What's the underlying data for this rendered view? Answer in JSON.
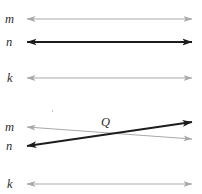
{
  "figure": {
    "width": 202,
    "height": 194,
    "background": "#ffffff",
    "colors": {
      "light_line": "#a9a9a9",
      "dark_line": "#1c1c1c",
      "label_text": "#2b2b2b"
    }
  },
  "panels": [
    {
      "id": "panel-top",
      "description": "Three parallel horizontal lines labeled m, n, k",
      "lines": [
        {
          "name": "line-m-top",
          "label": "m",
          "style": "light",
          "color": "#a9a9a9",
          "stroke_width": 1.1,
          "x1": 27,
          "y1": 19,
          "x2": 192,
          "y2": 19,
          "arrow_start": true,
          "arrow_end": true,
          "label_x": 5,
          "label_y": 13
        },
        {
          "name": "line-n-top",
          "label": "n",
          "style": "dark",
          "color": "#1c1c1c",
          "stroke_width": 1.8,
          "x1": 27,
          "y1": 42,
          "x2": 192,
          "y2": 42,
          "arrow_start": true,
          "arrow_end": true,
          "label_x": 6,
          "label_y": 36
        },
        {
          "name": "line-k-top",
          "label": "k",
          "style": "light",
          "color": "#a9a9a9",
          "stroke_width": 1.1,
          "x1": 27,
          "y1": 78,
          "x2": 192,
          "y2": 78,
          "arrow_start": true,
          "arrow_end": true,
          "label_x": 7,
          "label_y": 72
        }
      ]
    },
    {
      "id": "panel-bottom",
      "description": "Lines m and n intersecting at point Q, with parallel line k below",
      "lines": [
        {
          "name": "line-m-bottom",
          "label": "m",
          "style": "light",
          "color": "#a9a9a9",
          "stroke_width": 1.1,
          "x1": 27,
          "y1": 127,
          "x2": 192,
          "y2": 139,
          "arrow_start": true,
          "arrow_end": true,
          "label_x": 5,
          "label_y": 121
        },
        {
          "name": "line-n-bottom",
          "label": "n",
          "style": "dark",
          "color": "#1c1c1c",
          "stroke_width": 1.8,
          "x1": 27,
          "y1": 146,
          "x2": 192,
          "y2": 122,
          "arrow_start": true,
          "arrow_end": true,
          "label_x": 6,
          "label_y": 140
        },
        {
          "name": "line-k-bottom",
          "label": "k",
          "style": "light",
          "color": "#a9a9a9",
          "stroke_width": 1.1,
          "x1": 27,
          "y1": 184,
          "x2": 192,
          "y2": 184,
          "arrow_start": true,
          "arrow_end": true,
          "label_x": 7,
          "label_y": 178
        }
      ],
      "points": [
        {
          "name": "point-q",
          "label": "Q",
          "x": 110,
          "y": 134,
          "label_x": 101,
          "label_y": 116
        }
      ]
    }
  ],
  "labels": {
    "m_top": "m",
    "n_top": "n",
    "k_top": "k",
    "m_bottom": "m",
    "n_bottom": "n",
    "k_bottom": "k",
    "q_point": "Q"
  },
  "artifacts": [
    {
      "name": "scan-speck",
      "x": 52,
      "y": 110
    }
  ]
}
